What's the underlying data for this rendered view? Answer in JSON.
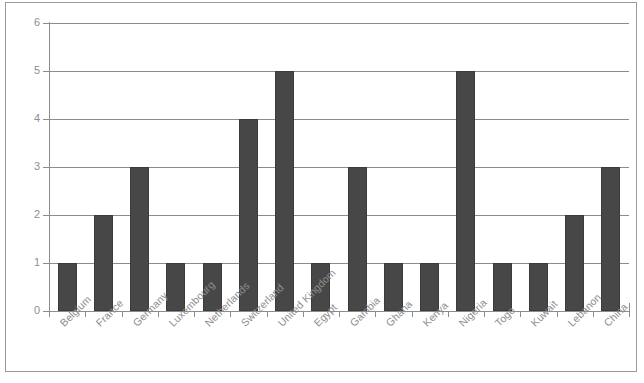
{
  "chart_data": {
    "type": "bar",
    "title": "",
    "subtitle": "",
    "xlabel": "",
    "ylabel": "",
    "ylim": [
      0,
      6
    ],
    "ytick_labels": [
      "0",
      "1",
      "2",
      "3",
      "4",
      "5",
      "6"
    ],
    "ytick_values": [
      0,
      1,
      2,
      3,
      4,
      5,
      6
    ],
    "grid": true,
    "legend": null,
    "legend_position": "none",
    "bar_color": "#474747",
    "grid_color": "#8c8c8c",
    "axis_color": "#8c8c8c",
    "label_color": "#8e8e8e",
    "background_color": "#ffffff",
    "frame_color": "#9a9a9a",
    "xtick_rotation": -45,
    "categories": [
      "Belgium",
      "France",
      "Germany",
      "Luxembourg",
      "Netherlands",
      "Switzerland",
      "United Kingdom",
      "Egypt",
      "Gambia",
      "Ghana",
      "Kenya",
      "Nigeria",
      "Togo",
      "Kuwait",
      "Lebanon",
      "China"
    ],
    "values": [
      1,
      2,
      3,
      1,
      1,
      4,
      5,
      1,
      3,
      1,
      1,
      5,
      1,
      1,
      2,
      3
    ]
  }
}
